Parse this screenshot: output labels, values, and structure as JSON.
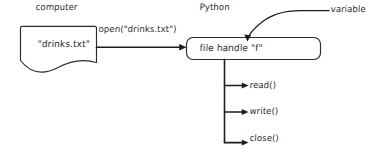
{
  "diagram": {
    "title_labels": {
      "computer": "computer",
      "python": "Python",
      "variable": "variable"
    },
    "nodes": {
      "file_document": {
        "label": "\"drinks.txt\"",
        "shape": "document",
        "side": "computer"
      },
      "file_handle": {
        "label": "file handle \"f\"",
        "shape": "rounded-rectangle",
        "side": "python"
      }
    },
    "edges": {
      "open_call": {
        "label": "open(\"drinks.txt\")",
        "from": "file_document",
        "to": "file_handle"
      },
      "variable_pointer": {
        "label": "variable",
        "to": "file_handle"
      }
    },
    "methods": [
      {
        "label": "read()"
      },
      {
        "label": "write()"
      },
      {
        "label": "close()"
      }
    ],
    "colors": {
      "ink": "#2b2b2b",
      "arrow": "#1d1d1d",
      "background": "#ffffff"
    }
  }
}
